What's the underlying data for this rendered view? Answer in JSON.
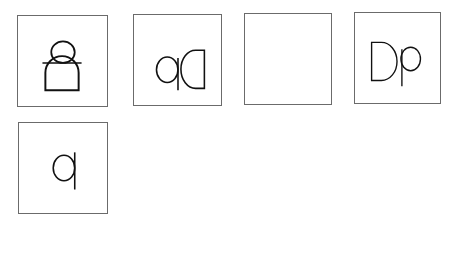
{
  "puzzle": {
    "sequence": [
      {
        "id": "seq-1",
        "figure": "Dp rotated 90° counter-clockwise"
      },
      {
        "id": "seq-2",
        "figure": "dD (Dp mirrored horizontally)"
      },
      {
        "id": "seq-3",
        "figure": "?",
        "text": "?"
      },
      {
        "id": "seq-4",
        "figure": "Dp"
      }
    ],
    "options": [
      {
        "id": "A",
        "label": "A",
        "figure": "qD (Dp rotated 180°)"
      },
      {
        "id": "B",
        "label": "B",
        "figure": "Dp rotated 90° clockwise"
      },
      {
        "id": "C",
        "label": "C",
        "figure": "Dp rotated 90° counter-clockwise (bold)"
      }
    ],
    "answer_label": "Answer",
    "answer_value": ""
  }
}
